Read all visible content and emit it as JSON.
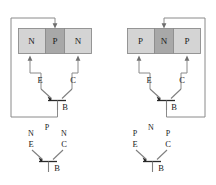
{
  "figure": {
    "background_color": "#ffffff",
    "wire_color": "#8a8a8a",
    "text_color": "#1a1a1a",
    "region_light_color": "#d4d4d4",
    "region_dark_color": "#a8a8a8",
    "region_outline_color": "#8d8d8d"
  },
  "devices": [
    {
      "id": "npn",
      "type_name": "NPN",
      "position": "left",
      "block": {
        "name": "doped-region-block",
        "regions": [
          {
            "label": "N",
            "shade": "light",
            "terminal": "E"
          },
          {
            "label": "P",
            "shade": "dark",
            "terminal": "B"
          },
          {
            "label": "N",
            "shade": "light",
            "terminal": "C"
          }
        ]
      },
      "symbol": {
        "name": "transistor-symbol",
        "terminals": [
          {
            "label": "E",
            "name": "emitter"
          },
          {
            "label": "C",
            "name": "collector"
          },
          {
            "label": "B",
            "name": "base"
          }
        ],
        "emitter_arrow_direction": "in"
      },
      "legend_symbol": {
        "name": "annotated-transistor-symbol",
        "region_labels": [
          {
            "label": "N",
            "near": "E"
          },
          {
            "label": "P",
            "near": "B"
          },
          {
            "label": "N",
            "near": "C"
          }
        ],
        "terminals": [
          {
            "label": "E",
            "name": "emitter"
          },
          {
            "label": "C",
            "name": "collector"
          },
          {
            "label": "B",
            "name": "base"
          }
        ]
      },
      "feedback_wire": {
        "name": "base-feedback-wire",
        "route": "left"
      }
    },
    {
      "id": "pnp",
      "type_name": "PNP",
      "position": "right",
      "block": {
        "name": "doped-region-block",
        "regions": [
          {
            "label": "P",
            "shade": "light",
            "terminal": "E"
          },
          {
            "label": "N",
            "shade": "dark",
            "terminal": "B"
          },
          {
            "label": "P",
            "shade": "light",
            "terminal": "C"
          }
        ]
      },
      "symbol": {
        "name": "transistor-symbol",
        "terminals": [
          {
            "label": "E",
            "name": "emitter"
          },
          {
            "label": "C",
            "name": "collector"
          },
          {
            "label": "B",
            "name": "base"
          }
        ],
        "emitter_arrow_direction": "in"
      },
      "legend_symbol": {
        "name": "annotated-transistor-symbol",
        "region_labels": [
          {
            "label": "P",
            "near": "E"
          },
          {
            "label": "N",
            "near": "B"
          },
          {
            "label": "P",
            "near": "C"
          }
        ],
        "terminals": [
          {
            "label": "E",
            "name": "emitter"
          },
          {
            "label": "C",
            "name": "collector"
          },
          {
            "label": "B",
            "name": "base"
          }
        ]
      },
      "feedback_wire": {
        "name": "base-feedback-wire",
        "route": "right"
      }
    }
  ]
}
